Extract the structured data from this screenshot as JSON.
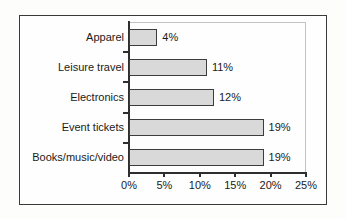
{
  "chart_data": {
    "type": "bar",
    "orientation": "horizontal",
    "title": "",
    "xlabel": "",
    "ylabel": "",
    "categories": [
      "Apparel",
      "Leisure travel",
      "Electronics",
      "Event tickets",
      "Books/music/video"
    ],
    "values": [
      4,
      11,
      12,
      19,
      19
    ],
    "value_labels": [
      "4%",
      "11%",
      "12%",
      "19%",
      "19%"
    ],
    "xlim": [
      0,
      25
    ],
    "xticks": [
      0,
      5,
      10,
      15,
      20,
      25
    ],
    "xtick_labels": [
      "0%",
      "5%",
      "10%",
      "15%",
      "20%",
      "25%"
    ],
    "grid": false,
    "legend": null,
    "bar_fill_color": "#d9d9d9",
    "bar_border_color": "#3c3c3c",
    "axis_color": "#2e2e2e",
    "text_color": "#1a1a1a",
    "frame_color": "#3a3a3a",
    "plot_border_color": "#c2c2c2"
  },
  "background_artifacts": {
    "line_top": "",
    "line_mid": "",
    "line_bottom": ""
  }
}
